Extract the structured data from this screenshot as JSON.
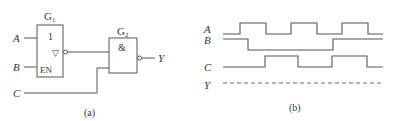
{
  "circuit": {
    "gate1": {
      "name": "G",
      "sub": "1",
      "symbol": "1",
      "enable_label": "EN",
      "output_symbol": "▽"
    },
    "gate2": {
      "name": "G",
      "sub": "2",
      "symbol": "&"
    },
    "inputs": {
      "a": "A",
      "b": "B",
      "c": "C"
    },
    "output": "Y",
    "caption": "(a)"
  },
  "timing": {
    "signals": [
      {
        "name": "A",
        "transitions_x": [
          240,
          266,
          291,
          317,
          342,
          368
        ]
      },
      {
        "name": "B",
        "transitions_x": [
          248,
          333
        ]
      },
      {
        "name": "C",
        "transitions_x": [
          265,
          298,
          332,
          367
        ]
      },
      {
        "name": "Y",
        "style": "dashed"
      }
    ],
    "caption": "(b)"
  }
}
